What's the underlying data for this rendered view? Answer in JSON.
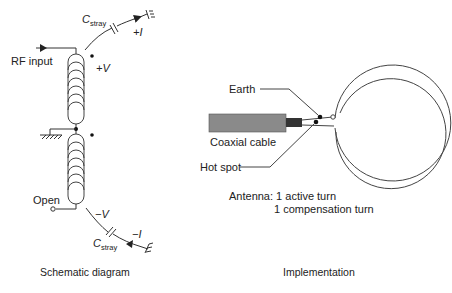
{
  "schematic": {
    "rf_input_label": "RF input",
    "open_label": "Open",
    "plus_v_label": "+V",
    "minus_v_label": "−V",
    "plus_i_label": "+I",
    "minus_i_label": "−I",
    "c_stray_top": {
      "main": "C",
      "sub": "stray"
    },
    "c_stray_bottom": {
      "main": "C",
      "sub": "stray"
    },
    "caption": "Schematic diagram",
    "top_coil_turns": 8,
    "bottom_coil_turns": 8
  },
  "implementation": {
    "earth_label": "Earth",
    "coax_label": "Coaxial cable",
    "hot_spot_label": "Hot spot",
    "antenna_line1": "Antenna: 1 active turn",
    "antenna_line2": "1 compensation turn",
    "caption": "Implementation",
    "colors": {
      "cable_jacket": "#8a8a8a",
      "cable_core": "#333333"
    }
  }
}
